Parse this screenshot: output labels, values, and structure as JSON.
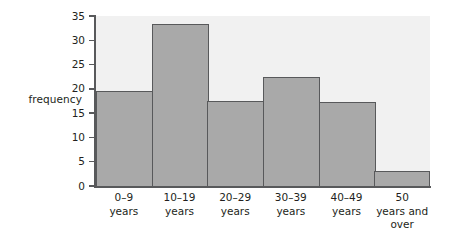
{
  "chart_data": {
    "type": "bar",
    "title": "",
    "subtitle": "",
    "xlabel": "",
    "ylabel": "frequency",
    "categories": [
      "0–9 years",
      "10–19 years",
      "20–29 years",
      "30–39 years",
      "40–49 years",
      "50 years and over"
    ],
    "category_lines": [
      [
        "0–9",
        "years"
      ],
      [
        "10–19",
        "years"
      ],
      [
        "20–29",
        "years"
      ],
      [
        "30–39",
        "years"
      ],
      [
        "40–49",
        "years"
      ],
      [
        "50",
        "years and",
        "over"
      ]
    ],
    "values": [
      19.5,
      33.3,
      17.5,
      22.4,
      17.4,
      3.1
    ],
    "ylim": [
      0,
      35
    ],
    "ytick_values": [
      0,
      5,
      10,
      15,
      20,
      25,
      30,
      35
    ],
    "ytick_labels": [
      "0",
      "5",
      "10",
      "15",
      "20",
      "25",
      "30",
      "35"
    ],
    "grid": false,
    "legend": null,
    "bar_fill_color": "#a9a9a9",
    "bar_edge_color": "#58595b",
    "plot_background_color": "#f1f1f1",
    "axis_color": "#58595b",
    "text_color": "#231f20",
    "page_background_color": "#ffffff"
  }
}
